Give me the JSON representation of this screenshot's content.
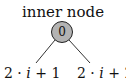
{
  "diagram": {
    "title": "inner node",
    "node": {
      "label": "0",
      "fill": "#b3b3b3",
      "stroke": "#222222"
    },
    "children": [
      {
        "pre": "2 · ",
        "var": "i",
        "post": " + 1"
      },
      {
        "pre": "2 · ",
        "var": "i",
        "post": " + 2"
      }
    ]
  }
}
